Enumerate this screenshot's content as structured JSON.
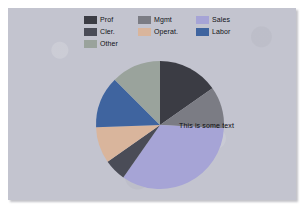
{
  "canvas": {
    "width": 304,
    "height": 209,
    "background": "#ffffff",
    "panel_background": "#c3c4cf"
  },
  "legend": {
    "position": "top-center",
    "items": [
      {
        "label": "Prof",
        "color": "#3b3c44",
        "col": 1,
        "row": 1
      },
      {
        "label": "Mgmt",
        "color": "#7b7c84",
        "col": 2,
        "row": 1
      },
      {
        "label": "Sales",
        "color": "#a6a4d6",
        "col": 3,
        "row": 1
      },
      {
        "label": "Cler.",
        "color": "#4a4c57",
        "col": 1,
        "row": 2
      },
      {
        "label": "Operat.",
        "color": "#d9b59c",
        "col": 2,
        "row": 2
      },
      {
        "label": "Labor",
        "color": "#3f649f",
        "col": 3,
        "row": 2
      },
      {
        "label": "Other",
        "color": "#9aa39c",
        "col": 1,
        "row": 3
      }
    ]
  },
  "annotation": {
    "text": "This is some text"
  },
  "chart_data": {
    "type": "pie",
    "title": "",
    "subtitle": "",
    "xlabel": "",
    "ylabel": "",
    "legend_position": "top-center",
    "grid": false,
    "start_angle_deg": 0,
    "direction": "clockwise",
    "center": {
      "x": 152,
      "y": 117
    },
    "radius": 64,
    "categories": [
      "Prof",
      "Mgmt",
      "Sales",
      "Cler.",
      "Operat.",
      "Labor",
      "Other"
    ],
    "values": [
      15.3,
      10.6,
      33.9,
      5.6,
      9.2,
      13.1,
      12.3
    ],
    "angles_deg": [
      55,
      38,
      122,
      20,
      33,
      47,
      45
    ],
    "colors": [
      "#3b3c44",
      "#7b7c84",
      "#a6a4d6",
      "#4a4c57",
      "#d9b59c",
      "#3f649f",
      "#9aa39c"
    ],
    "annotations": [
      {
        "text": "This is some text",
        "x": 171,
        "y": 118,
        "attached_to": "Sales"
      }
    ]
  }
}
